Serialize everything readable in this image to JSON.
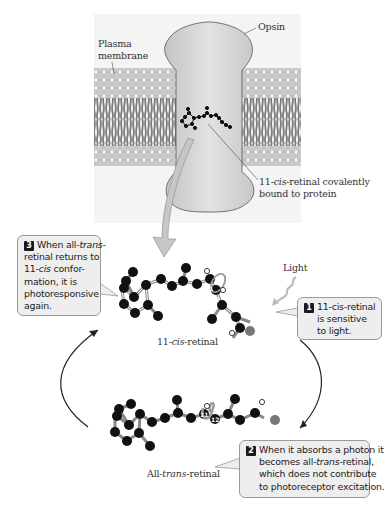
{
  "figure": {
    "labels": {
      "opsin": "Opsin",
      "plasma_membrane_line1": "Plasma",
      "plasma_membrane_line2": "membrane",
      "bound_line1_pre": "11-",
      "bound_line1_italic": "cis",
      "bound_line1_post": "-retinal covalently",
      "bound_line2": "bound to protein",
      "light": "Light",
      "cis_retinal_pre": "11-",
      "cis_retinal_italic": "cis",
      "cis_retinal_post": "-retinal",
      "trans_retinal_pre": "All-",
      "trans_retinal_italic": "trans",
      "trans_retinal_post": "-retinal"
    },
    "atom_markers": {
      "top_11": "11",
      "top_12": "12",
      "bottom_11": "11",
      "bottom_12": "12"
    },
    "callouts": [
      {
        "step": "1",
        "lines": [
          "11-cis-retinal",
          "is sensitive",
          "to light."
        ]
      },
      {
        "step": "2",
        "line1": "When it absorbs a photon it",
        "line2_pre": "becomes all-",
        "line2_italic": "trans",
        "line2_post": "-retinal,",
        "line3": "which does not contribute",
        "line4": "to photoreceptor excitation."
      },
      {
        "step": "3",
        "line1_pre": "When all-",
        "line1_italic": "trans",
        "line1_post": "-",
        "line2": "retinal returns to",
        "line3_pre": "11-",
        "line3_italic": "cis",
        "line3_post": " confor-",
        "line4": "mation, it is",
        "line5": "photoresponsive",
        "line6": "again."
      }
    ],
    "colors": {
      "membrane_bg": "#f3f3f3",
      "lipid_head": "#c9c9c9",
      "lipid_tail": "#7a7a7a",
      "opsin_fill": "#d6d6d6",
      "atom_carbon": "#111111",
      "atom_oxygen": "#777777",
      "atom_hydrogen": "#ffffff",
      "callout_bg": "#eeeeee",
      "arrow": "#222222"
    }
  }
}
